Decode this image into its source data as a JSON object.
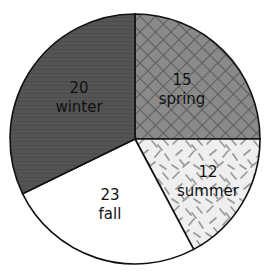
{
  "chart_data": {
    "type": "pie",
    "title": "",
    "subtitle": "",
    "xlabel": "",
    "ylabel": "",
    "legend_position": "none",
    "grid": false,
    "total": 70,
    "categories": [
      "spring",
      "summer",
      "fall",
      "winter"
    ],
    "values": [
      15,
      12,
      23,
      20
    ],
    "slices": [
      {
        "label": "spring",
        "value": 15,
        "value_text": "15",
        "label_text": "spring",
        "start_angle_deg": 0,
        "end_angle_deg": 90,
        "fill_style": "crosshatch",
        "fill_color": "#8a8a8a",
        "pattern_color": "#5e5e5e",
        "text_color": "#111111",
        "label_x": 182,
        "label_y": 80
      },
      {
        "label": "summer",
        "value": 12,
        "value_text": "12",
        "label_text": "summer",
        "start_angle_deg": 90,
        "end_angle_deg": 152,
        "fill_style": "scattered-dashes",
        "fill_color": "#efefef",
        "pattern_color": "#9a9a9a",
        "text_color": "#111111",
        "label_x": 208,
        "label_y": 172
      },
      {
        "label": "fall",
        "value": 23,
        "value_text": "23",
        "label_text": "fall",
        "start_angle_deg": 152,
        "end_angle_deg": 244,
        "fill_style": "solid",
        "fill_color": "#ffffff",
        "pattern_color": "#ffffff",
        "text_color": "#111111",
        "label_x": 110,
        "label_y": 195
      },
      {
        "label": "winter",
        "value": 20,
        "value_text": "20",
        "label_text": "winter",
        "start_angle_deg": 244,
        "end_angle_deg": 360,
        "fill_style": "solid-textured",
        "fill_color": "#545454",
        "pattern_color": "#4a4a4a",
        "text_color": "#111111",
        "label_x": 79,
        "label_y": 88
      }
    ],
    "geometry": {
      "center_x": 135,
      "center_y": 139,
      "radius": 125,
      "stroke_color": "#111111",
      "stroke_width": 1.6
    },
    "background_color": "#ffffff"
  }
}
